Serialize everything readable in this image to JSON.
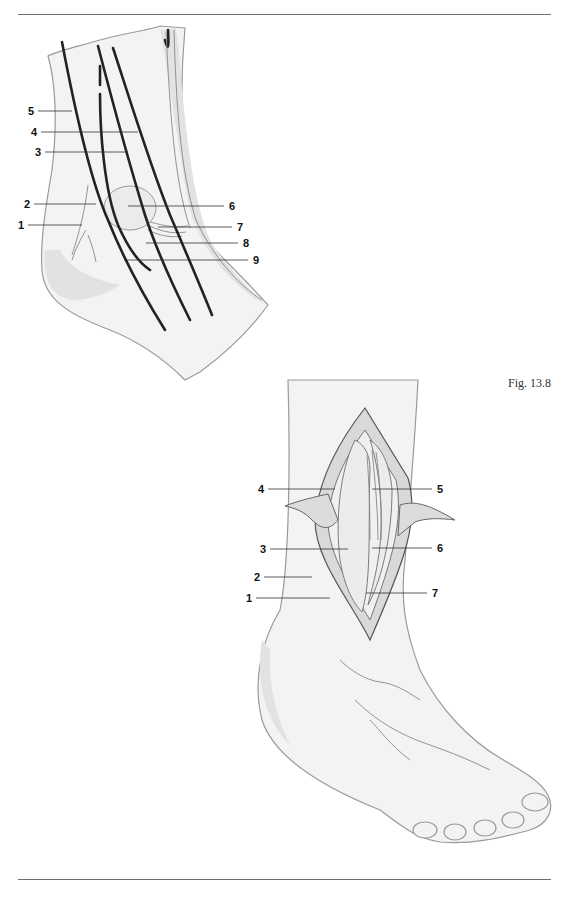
{
  "page": {
    "figure_caption": "Fig. 13.8"
  },
  "figure_top": {
    "name": "ankle-lateral-view-nerves",
    "labels": [
      {
        "id": "1",
        "text": "1",
        "x": 18,
        "y": 228,
        "lx1": 28,
        "lx2": 82,
        "ly": 225
      },
      {
        "id": "2",
        "text": "2",
        "x": 24,
        "y": 207,
        "lx1": 34,
        "lx2": 96,
        "ly": 204
      },
      {
        "id": "3",
        "text": "3",
        "x": 35,
        "y": 155,
        "lx1": 45,
        "lx2": 128,
        "ly": 152
      },
      {
        "id": "4",
        "text": "4",
        "x": 31,
        "y": 135,
        "lx1": 41,
        "lx2": 138,
        "ly": 132
      },
      {
        "id": "5",
        "text": "5",
        "x": 28,
        "y": 114,
        "lx1": 38,
        "lx2": 72,
        "ly": 111
      },
      {
        "id": "6",
        "text": "6",
        "x": 231,
        "y": 210,
        "lx1": 128,
        "lx2": 224,
        "ly": 206
      },
      {
        "id": "7",
        "text": "7",
        "x": 239,
        "y": 230,
        "lx1": 158,
        "lx2": 232,
        "ly": 227
      },
      {
        "id": "8",
        "text": "8",
        "x": 245,
        "y": 246,
        "lx1": 146,
        "lx2": 238,
        "ly": 243
      },
      {
        "id": "9",
        "text": "9",
        "x": 255,
        "y": 264,
        "lx1": 124,
        "lx2": 248,
        "ly": 260
      }
    ]
  },
  "figure_bottom": {
    "name": "ankle-anterior-incision-view",
    "labels": [
      {
        "id": "4",
        "text": "4",
        "x": 258,
        "y": 493,
        "lx1": 268,
        "lx2": 335,
        "ly": 489,
        "side": "left"
      },
      {
        "id": "3",
        "text": "3",
        "x": 260,
        "y": 553,
        "lx1": 270,
        "lx2": 348,
        "ly": 549,
        "side": "left"
      },
      {
        "id": "2",
        "text": "2",
        "x": 254,
        "y": 581,
        "lx1": 264,
        "lx2": 312,
        "ly": 577,
        "side": "left"
      },
      {
        "id": "1",
        "text": "1",
        "x": 246,
        "y": 602,
        "lx1": 256,
        "lx2": 330,
        "ly": 598,
        "side": "left"
      },
      {
        "id": "5",
        "text": "5",
        "x": 438,
        "y": 493,
        "lx1": 372,
        "lx2": 432,
        "ly": 489,
        "side": "right"
      },
      {
        "id": "6",
        "text": "6",
        "x": 438,
        "y": 552,
        "lx1": 372,
        "lx2": 432,
        "ly": 548,
        "side": "right"
      },
      {
        "id": "7",
        "text": "7",
        "x": 433,
        "y": 597,
        "lx1": 366,
        "lx2": 427,
        "ly": 593,
        "side": "right"
      }
    ]
  }
}
